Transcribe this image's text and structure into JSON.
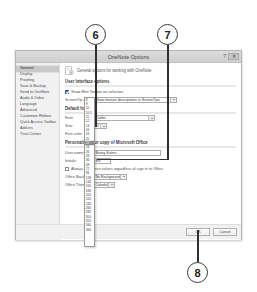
{
  "callouts": [
    {
      "label": "6"
    },
    {
      "label": "7"
    },
    {
      "label": "8"
    }
  ],
  "dialog": {
    "title": "OneNote Options",
    "help_label": "?",
    "close_label": "✕",
    "sidebar": {
      "items": [
        {
          "label": "General",
          "selected": true
        },
        {
          "label": "Display",
          "selected": false
        },
        {
          "label": "Proofing",
          "selected": false
        },
        {
          "label": "Save & Backup",
          "selected": false
        },
        {
          "label": "Send to OneNote",
          "selected": false
        },
        {
          "label": "Audio & Video",
          "selected": false
        },
        {
          "label": "Language",
          "selected": false
        },
        {
          "label": "Advanced",
          "selected": false
        },
        {
          "label": "Customize Ribbon",
          "selected": false
        },
        {
          "label": "Quick Access Toolbar",
          "selected": false
        },
        {
          "label": "Add-ins",
          "selected": false
        },
        {
          "label": "Trust Center",
          "selected": false
        }
      ]
    },
    "pane": {
      "header_icon": "gear-icon",
      "header_text": "General options for working with OneNote.",
      "ui_section": {
        "title": "User Interface options",
        "mini_toolbar_label": "Show Mini Toolbar on selection",
        "mini_toolbar_checked": true,
        "screentip_label": "ScreenTip style",
        "screentip_value": "Show feature descriptions in ScreenTips"
      },
      "font_section": {
        "title": "Default font",
        "font_label": "Font:",
        "font_value": "Calibri",
        "size_label": "Size:",
        "size_value": "11",
        "color_label": "Font color:",
        "size_options": [
          "8",
          "9",
          "10",
          "10.5",
          "11",
          "12",
          "14",
          "16",
          "18",
          "20",
          "22",
          "24",
          "26",
          "28",
          "36",
          "48",
          "72",
          "96",
          "128",
          "144",
          "160",
          "180",
          "200",
          "220",
          "240",
          "260",
          "280",
          "300",
          "320",
          "340",
          "360"
        ],
        "size_highlighted": "22"
      },
      "personalize_section": {
        "title": "Personalize your copy of Microsoft Office",
        "username_label": "User name:",
        "username_value": "Bossy Suites",
        "initials_label": "Initials:",
        "initials_value": "BS",
        "always_label": "Always use these values regardless of sign in to Office.",
        "always_checked": false,
        "background_label": "Office Background:",
        "background_value": "No Background",
        "theme_label": "Office Theme:",
        "theme_value": "Colorful"
      }
    },
    "buttons": {
      "ok": "OK",
      "cancel": "Cancel"
    }
  }
}
